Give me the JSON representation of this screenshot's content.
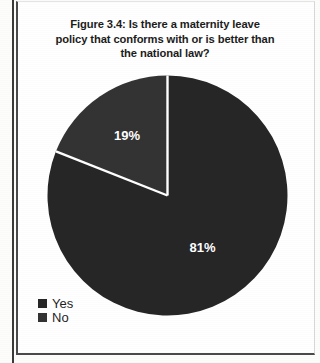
{
  "figure": {
    "title_line_1": "Figure 3.4: Is there a maternity leave",
    "title_line_2": "policy that conforms with or is better than",
    "title_line_3": "the national law?"
  },
  "legend": {
    "items": [
      {
        "label": "Yes",
        "color": "#262626",
        "swatch_icon": "square-swatch-icon"
      },
      {
        "label": "No",
        "color": "#333333",
        "swatch_icon": "square-swatch-icon"
      }
    ]
  },
  "labels": {
    "yes_percent": "81%",
    "no_percent": "19%"
  },
  "chart_data": {
    "type": "pie",
    "title": "Figure 3.4: Is there a maternity leave policy that conforms with or is better than the national law?",
    "categories": [
      "Yes",
      "No"
    ],
    "values": [
      81,
      19
    ],
    "value_labels": [
      "81%",
      "19%"
    ],
    "colors": [
      "#262626",
      "#333333"
    ],
    "units": "percent",
    "start_angle_deg": 0,
    "direction": "clockwise",
    "legend_position": "bottom-left",
    "grid": false,
    "slice_separator_color": "#ffffff",
    "data_label_color": "#ffffff"
  }
}
